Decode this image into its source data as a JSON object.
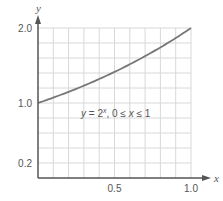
{
  "chart_data": {
    "type": "line",
    "title": "",
    "xlabel": "x",
    "ylabel": "y",
    "xlim": [
      0,
      1.0
    ],
    "ylim": [
      0,
      2.0
    ],
    "grid": true,
    "grid_step": {
      "x": 0.1,
      "y": 0.2
    },
    "x_ticks": [
      {
        "value": 0.5,
        "label": "0.5"
      },
      {
        "value": 1.0,
        "label": "1.0"
      }
    ],
    "y_ticks": [
      {
        "value": 0.2,
        "label": "0.2"
      },
      {
        "value": 1.0,
        "label": "1.0"
      },
      {
        "value": 2.0,
        "label": "2.0"
      }
    ],
    "series": [
      {
        "name": "y = 2^x",
        "function": "2^x",
        "x": [
          0,
          0.1,
          0.2,
          0.3,
          0.4,
          0.5,
          0.6,
          0.7,
          0.8,
          0.9,
          1.0
        ],
        "values": [
          1.0,
          1.072,
          1.149,
          1.231,
          1.32,
          1.414,
          1.516,
          1.625,
          1.741,
          1.866,
          2.0
        ],
        "color": "#777777"
      }
    ],
    "annotations": [
      {
        "text": "y = 2^x,   0 ≤ x ≤ 1",
        "x": 0.5,
        "y": 1.05
      }
    ],
    "legend": null
  },
  "labels": {
    "x_axis_name": "x",
    "y_axis_name": "y",
    "annotation_y": "y",
    "annotation_eq": " = 2",
    "annotation_exp": "x",
    "annotation_domain_pre": ",   0 ≤ ",
    "annotation_domain_var": "x",
    "annotation_domain_post": " ≤ 1"
  },
  "colors": {
    "axis": "#555555",
    "grid": "#d8d8d8",
    "curve": "#7a7a7a",
    "text": "#555555"
  }
}
